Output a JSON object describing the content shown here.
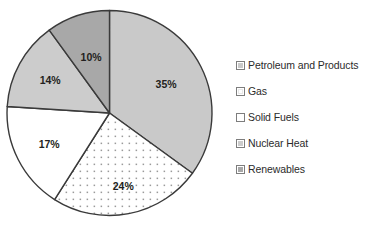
{
  "chart_data": {
    "type": "pie",
    "title": "",
    "subtitle": "",
    "xlabel": "",
    "ylabel": "",
    "grid": false,
    "legend_position": "right",
    "start_angle_deg": 0,
    "direction": "clockwise",
    "categories": [
      "Petroleum and Products",
      "Gas",
      "Solid Fuels",
      "Nuclear Heat",
      "Renewables"
    ],
    "values": [
      35,
      24,
      17,
      14,
      10
    ],
    "value_unit": "%",
    "data_labels": [
      "35%",
      "24%",
      "17%",
      "14%",
      "10%"
    ],
    "slice_styles": [
      {
        "name": "Petroleum and Products",
        "fill": "#c9c9c9",
        "pattern": "solid",
        "stroke": "#3a3a3a"
      },
      {
        "name": "Gas",
        "fill": "#ffffff",
        "pattern": "dots",
        "stroke": "#3a3a3a"
      },
      {
        "name": "Solid Fuels",
        "fill": "#ffffff",
        "pattern": "solid",
        "stroke": "#3a3a3a"
      },
      {
        "name": "Nuclear Heat",
        "fill": "#cccccc",
        "pattern": "solid",
        "stroke": "#3a3a3a"
      },
      {
        "name": "Renewables",
        "fill": "#a8a8a8",
        "pattern": "solid",
        "stroke": "#3a3a3a"
      }
    ]
  },
  "legend": {
    "items": [
      {
        "label": "Petroleum and Products"
      },
      {
        "label": "Gas"
      },
      {
        "label": "Solid Fuels"
      },
      {
        "label": "Nuclear Heat"
      },
      {
        "label": "Renewables"
      }
    ]
  },
  "labels": {
    "petroleum": "35%",
    "gas": "24%",
    "solid_fuels": "17%",
    "nuclear_heat": "14%",
    "renewables": "10%"
  },
  "colors": {
    "outline": "#3a3a3a",
    "petroleum": "#c9c9c9",
    "gas": "#ffffff",
    "solid_fuels": "#ffffff",
    "nuclear_heat": "#cccccc",
    "renewables": "#a8a8a8",
    "dot": "#9a9a9a",
    "text": "#2b2b2b",
    "background": "#ffffff"
  }
}
